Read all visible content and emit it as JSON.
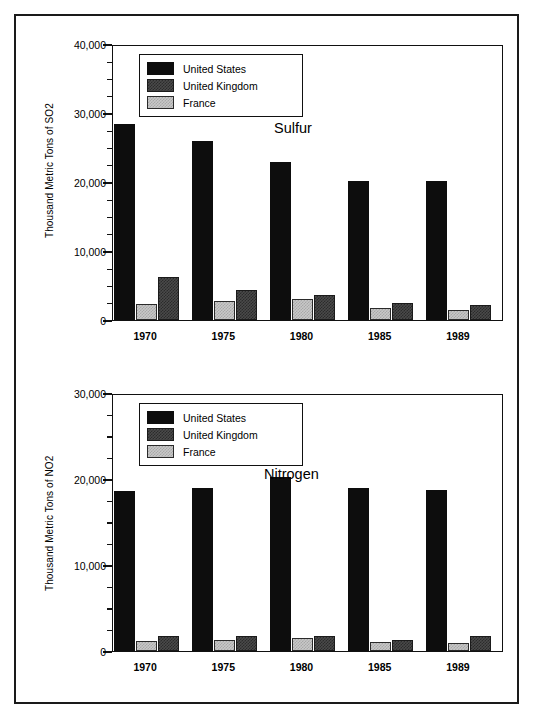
{
  "figure": {
    "background": "#ffffff",
    "frame_color": "#1a1a1a"
  },
  "series_colors": {
    "united_states": "#0d0d0d",
    "united_kingdom": "#4a4a4a",
    "france": "#c8c8c8"
  },
  "legend": {
    "items": [
      {
        "key": "us",
        "label": "United States"
      },
      {
        "key": "uk",
        "label": "United Kingdom"
      },
      {
        "key": "fr",
        "label": "France"
      }
    ]
  },
  "chart_data": [
    {
      "id": "sulfur",
      "type": "bar",
      "title": "Sulfur",
      "xlabel": "",
      "ylabel": "Thousand Metric Tons of SO2",
      "ylim": [
        0,
        40000
      ],
      "ytick_step": 10000,
      "yminor_step": 2500,
      "ytick_labels": [
        "0",
        "10,000",
        "20,000",
        "30,000",
        "40,000"
      ],
      "ytick_values": [
        0,
        10000,
        20000,
        30000,
        40000
      ],
      "grid": false,
      "legend_position": "upper-center",
      "categories": [
        "1970",
        "1975",
        "1980",
        "1985",
        "1989"
      ],
      "bar_order": [
        "United States",
        "France",
        "United Kingdom"
      ],
      "series": [
        {
          "name": "United States",
          "key": "us",
          "values": [
            28400,
            25900,
            22900,
            20200,
            20200
          ]
        },
        {
          "name": "France",
          "key": "fr",
          "values": [
            2300,
            2800,
            3000,
            1700,
            1400
          ]
        },
        {
          "name": "United Kingdom",
          "key": "uk",
          "values": [
            6300,
            4300,
            3600,
            2500,
            2200
          ]
        }
      ]
    },
    {
      "id": "nitrogen",
      "type": "bar",
      "title": "Nitrogen",
      "xlabel": "",
      "ylabel": "Thousand Metric Tons of NO2",
      "ylim": [
        0,
        30000
      ],
      "ytick_step": 10000,
      "yminor_step": 2500,
      "ytick_labels": [
        "0",
        "10,000",
        "20,000",
        "30,000"
      ],
      "ytick_values": [
        0,
        10000,
        20000,
        30000
      ],
      "grid": false,
      "legend_position": "upper-center",
      "categories": [
        "1970",
        "1975",
        "1980",
        "1985",
        "1989"
      ],
      "bar_order": [
        "United States",
        "France",
        "United Kingdom"
      ],
      "series": [
        {
          "name": "United States",
          "key": "us",
          "values": [
            18600,
            18900,
            20200,
            19000,
            18700
          ]
        },
        {
          "name": "France",
          "key": "fr",
          "values": [
            1200,
            1300,
            1500,
            1100,
            900
          ]
        },
        {
          "name": "United Kingdom",
          "key": "uk",
          "values": [
            1800,
            1800,
            1700,
            1300,
            1800
          ]
        }
      ]
    }
  ]
}
